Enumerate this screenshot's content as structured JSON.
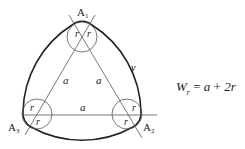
{
  "figure": {
    "vertices": [
      {
        "label": "A",
        "sub": "1"
      },
      {
        "label": "A",
        "sub": "2"
      },
      {
        "label": "A",
        "sub": "3"
      }
    ],
    "side_labels": [
      "a",
      "a",
      "a"
    ],
    "radius_labels": [
      "r",
      "r",
      "r",
      "r",
      "r",
      "r"
    ],
    "curve_label": "γ",
    "formula": {
      "lhs": "W",
      "lhs_sub": "r",
      "eq": " = ",
      "rhs_a": "a",
      "plus": " + ",
      "rhs_2r": "2r"
    },
    "colors": {
      "stroke": "#222222",
      "thin_stroke": "#555555",
      "background": "#ffffff"
    }
  }
}
